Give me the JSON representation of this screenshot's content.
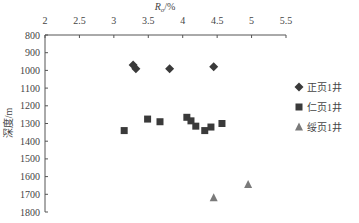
{
  "chart_data": {
    "type": "scatter",
    "title": "",
    "xlabel": "Ro/%",
    "xlabel_main": "R",
    "xlabel_sub": "o",
    "xlabel_unit": "/%",
    "ylabel": "深度/m",
    "xlim": [
      2,
      5.5
    ],
    "ylim": [
      800,
      1800
    ],
    "y_inverted": true,
    "x_axis_position": "top",
    "x_ticks": [
      2,
      2.5,
      3,
      3.5,
      4,
      4.5,
      5,
      5.5
    ],
    "x_tick_labels": [
      "2",
      "2.5",
      "3",
      "3.5",
      "4",
      "4.5",
      "5",
      "5.5"
    ],
    "y_ticks": [
      800,
      900,
      1000,
      1100,
      1200,
      1300,
      1400,
      1500,
      1600,
      1700,
      1800
    ],
    "y_tick_labels": [
      "800",
      "900",
      "1000",
      "1100",
      "1200",
      "1300",
      "1400",
      "1500",
      "1600",
      "1700",
      "1800"
    ],
    "grid": false,
    "legend_position": "right",
    "series": [
      {
        "name": "正页1井",
        "marker": "diamond",
        "color": "#3a3a3a",
        "points": [
          [
            3.28,
            970
          ],
          [
            3.32,
            990
          ],
          [
            3.81,
            990
          ],
          [
            4.45,
            980
          ]
        ]
      },
      {
        "name": "仁页1井",
        "marker": "square",
        "color": "#3a3a3a",
        "points": [
          [
            3.15,
            1340
          ],
          [
            3.49,
            1275
          ],
          [
            3.67,
            1290
          ],
          [
            4.06,
            1265
          ],
          [
            4.12,
            1285
          ],
          [
            4.19,
            1315
          ],
          [
            4.32,
            1340
          ],
          [
            4.41,
            1320
          ],
          [
            4.57,
            1300
          ]
        ]
      },
      {
        "name": "绥页1井",
        "marker": "triangle",
        "color": "#7a7a7a",
        "points": [
          [
            4.45,
            1720
          ],
          [
            4.95,
            1645
          ]
        ]
      }
    ]
  }
}
